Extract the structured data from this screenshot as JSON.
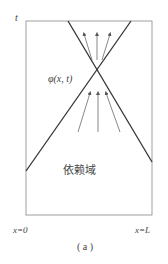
{
  "diagram": {
    "axis_t_label": "t",
    "point_label": "φ(x, t)",
    "region_label": "依赖域",
    "left_boundary_label": "x=0",
    "right_boundary_label": "x=L",
    "caption": "( a )"
  }
}
